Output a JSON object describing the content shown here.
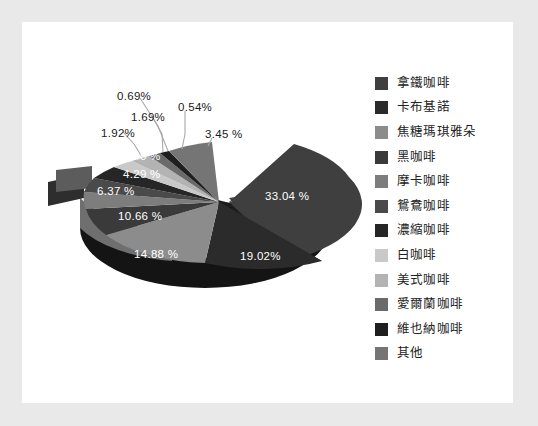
{
  "chart_data": {
    "type": "pie",
    "title": "",
    "subtitle": "",
    "xlabel": "",
    "ylabel": "",
    "legend_position": "right",
    "grid": false,
    "exploded_slice": "拿鐵咖啡",
    "value_suffix": "%",
    "categories": [
      "拿鐵咖啡",
      "卡布基諾",
      "焦糖瑪琪雅朵",
      "黑咖啡",
      "摩卡咖啡",
      "鴛鴦咖啡",
      "濃縮咖啡",
      "白咖啡",
      "美式咖啡",
      "愛爾蘭咖啡",
      "維也納咖啡",
      "其他"
    ],
    "values": [
      33.04,
      19.02,
      14.88,
      10.66,
      6.37,
      4.29,
      3.45,
      1.92,
      1.69,
      0.69,
      0.54,
      3.45
    ],
    "labels": [
      "33.04 %",
      "19.02%",
      "14.88 %",
      "10.66 %",
      "6.37 %",
      "4.29 %",
      "3.45 %",
      "1.92%",
      "1.69%",
      "0.69%",
      "0.54%",
      "3.45 %"
    ],
    "colors": [
      "#3f3f3f",
      "#2b2b2b",
      "#8c8c8c",
      "#3a3a3a",
      "#7d7d7d",
      "#4a4a4a",
      "#262626",
      "#c9c9c9",
      "#b3b3b3",
      "#6a6a6a",
      "#1f1f1f",
      "#757575"
    ]
  },
  "legend": {
    "items": [
      {
        "label": "拿鐵咖啡",
        "color": "#3f3f3f"
      },
      {
        "label": "卡布基諾",
        "color": "#2b2b2b"
      },
      {
        "label": "焦糖瑪琪雅朵",
        "color": "#8c8c8c"
      },
      {
        "label": "黑咖啡",
        "color": "#3a3a3a"
      },
      {
        "label": "摩卡咖啡",
        "color": "#7d7d7d"
      },
      {
        "label": "鴛鴦咖啡",
        "color": "#4a4a4a"
      },
      {
        "label": "濃縮咖啡",
        "color": "#262626"
      },
      {
        "label": "白咖啡",
        "color": "#c9c9c9"
      },
      {
        "label": "美式咖啡",
        "color": "#b3b3b3"
      },
      {
        "label": "愛爾蘭咖啡",
        "color": "#6a6a6a"
      },
      {
        "label": "維也納咖啡",
        "color": "#1f1f1f"
      },
      {
        "label": "其他",
        "color": "#757575"
      }
    ]
  },
  "slice_labels": [
    {
      "text": "33.04 %",
      "x": 243,
      "y": 168,
      "placement": "inside"
    },
    {
      "text": "19.02%",
      "x": 218,
      "y": 228,
      "placement": "inside"
    },
    {
      "text": "14.88 %",
      "x": 112,
      "y": 226,
      "placement": "inside"
    },
    {
      "text": "10.66 %",
      "x": 96,
      "y": 188,
      "placement": "inside"
    },
    {
      "text": "6.37 %",
      "x": 75,
      "y": 163,
      "placement": "inside"
    },
    {
      "text": "4.29 %",
      "x": 101,
      "y": 146,
      "placement": "inside"
    },
    {
      "text": "3.45 %",
      "x": 101,
      "y": 128,
      "placement": "inside"
    },
    {
      "text": "1.92%",
      "x": 79,
      "y": 105,
      "placement": "outside"
    },
    {
      "text": "1.69%",
      "x": 109,
      "y": 89,
      "placement": "outside"
    },
    {
      "text": "0.69%",
      "x": 95,
      "y": 68,
      "placement": "outside"
    },
    {
      "text": "0.54%",
      "x": 156,
      "y": 79,
      "placement": "outside"
    },
    {
      "text": "3.45 %",
      "x": 183,
      "y": 106,
      "placement": "outside"
    }
  ],
  "colors": {
    "frame_background": "#e9e9e9",
    "panel_background": "#ffffff",
    "label_inside": "#ffffff",
    "label_outside": "#1a1a1a",
    "leader_line": "#a8a8a8"
  }
}
